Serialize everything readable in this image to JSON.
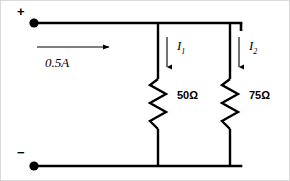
{
  "diagram": {
    "background_color": "#ffffff",
    "line_color": "#000000",
    "terminals": {
      "positive_symbol": "+",
      "negative_symbol": "−"
    },
    "source": {
      "label": "0.5A",
      "direction": "right"
    },
    "branches": [
      {
        "current_label": "I",
        "current_subscript": "1",
        "resistance_label": "50Ω",
        "direction": "down"
      },
      {
        "current_label": "I",
        "current_subscript": "2",
        "resistance_label": "75Ω",
        "direction": "down"
      }
    ]
  }
}
